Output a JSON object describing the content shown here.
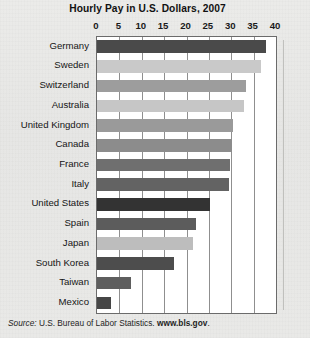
{
  "figure": {
    "title": "Hourly Pay in U.S. Dollars, 2007",
    "source_label": "Source:",
    "source_body": " U.S. Bureau of Labor Statistics. ",
    "source_url": "www.bls.gov",
    "source_end": "."
  },
  "chart_data": {
    "type": "bar",
    "orientation": "horizontal",
    "title": "Hourly Pay in U.S. Dollars, 2007",
    "xlabel": "",
    "ylabel": "",
    "xlim": [
      0,
      40
    ],
    "xticks": [
      0,
      5,
      10,
      15,
      20,
      25,
      30,
      35,
      40
    ],
    "xtick_labels": [
      "0",
      "5",
      "10",
      "15",
      "20",
      "25",
      "30",
      "35",
      "40"
    ],
    "grid": "vertical",
    "legend": "none",
    "categories": [
      "Germany",
      "Sweden",
      "Switzerland",
      "Australia",
      "United Kingdom",
      "Canada",
      "France",
      "Italy",
      "United States",
      "Spain",
      "Japan",
      "South Korea",
      "Taiwan",
      "Mexico"
    ],
    "values": [
      37.7,
      36.6,
      33.3,
      32.8,
      30.4,
      30.2,
      29.7,
      29.5,
      25.2,
      22.1,
      21.5,
      17.2,
      7.6,
      3.1
    ],
    "bar_colors": [
      "#4a4a4a",
      "#c9c9c9",
      "#9d9d9d",
      "#c6c6c6",
      "#9a9a9a",
      "#8c8c8c",
      "#6f6f6f",
      "#636363",
      "#333333",
      "#5c5c5c",
      "#bdbdbd",
      "#4d4d4d",
      "#5e5e5e",
      "#464646"
    ]
  },
  "colors": {
    "plot_background": "#ffffff",
    "page_background": "#e8e8e6",
    "gridline": "#8f8f8f",
    "frame": "#6b6b6b",
    "text": "#151515"
  }
}
